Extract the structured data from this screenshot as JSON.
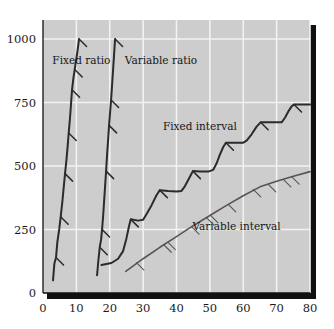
{
  "chart_data": {
    "type": "line",
    "title": "",
    "subtitle": "",
    "xlabel": "",
    "ylabel": "",
    "xlim": [
      0,
      80
    ],
    "ylim": [
      0,
      1075
    ],
    "grid": true,
    "legend_position": "inline-annotations",
    "xticks": [
      "0",
      "10",
      "20",
      "30",
      "40",
      "50",
      "60",
      "70",
      "80"
    ],
    "xtick_values": [
      0,
      10,
      20,
      30,
      40,
      50,
      60,
      70,
      80
    ],
    "yticks": [
      "0",
      "250",
      "500",
      "750",
      "1000"
    ],
    "ytick_values": [
      0,
      250,
      500,
      750,
      1000
    ],
    "plot_bgcolor": "#cdcdcd",
    "grid_color": "#f2f2f2",
    "axis_color": "#111111",
    "series": [
      {
        "name": "Fixed ratio",
        "color": "#2b2b2b",
        "width": 2.0,
        "label_x": 11.5,
        "label_y": 900,
        "label_anchor": "middle",
        "points": [
          [
            3.0,
            50
          ],
          [
            3.4,
            115
          ],
          [
            3.9,
            140
          ],
          [
            4.3,
            200
          ],
          [
            4.9,
            255
          ],
          [
            5.3,
            300
          ],
          [
            5.8,
            360
          ],
          [
            6.2,
            415
          ],
          [
            6.6,
            470
          ],
          [
            7.0,
            520
          ],
          [
            7.4,
            580
          ],
          [
            7.7,
            630
          ],
          [
            8.1,
            690
          ],
          [
            8.4,
            745
          ],
          [
            8.7,
            800
          ],
          [
            9.1,
            845
          ],
          [
            9.5,
            880
          ],
          [
            9.9,
            915
          ],
          [
            10.3,
            950
          ],
          [
            10.8,
            1000
          ]
        ],
        "hatches": [
          {
            "x": 3.9,
            "y": 140
          },
          {
            "x": 5.3,
            "y": 300
          },
          {
            "x": 6.6,
            "y": 470
          },
          {
            "x": 7.7,
            "y": 630
          },
          {
            "x": 8.7,
            "y": 800
          },
          {
            "x": 9.5,
            "y": 880
          },
          {
            "x": 10.8,
            "y": 1000
          }
        ]
      },
      {
        "name": "Variable ratio",
        "color": "#2b2b2b",
        "width": 2.0,
        "label_x": 24.5,
        "label_y": 900,
        "label_anchor": "start",
        "points": [
          [
            16.2,
            70
          ],
          [
            16.6,
            130
          ],
          [
            17.0,
            180
          ],
          [
            17.4,
            210
          ],
          [
            17.7,
            250
          ],
          [
            18.0,
            300
          ],
          [
            18.3,
            360
          ],
          [
            18.6,
            420
          ],
          [
            18.9,
            480
          ],
          [
            19.2,
            545
          ],
          [
            19.5,
            600
          ],
          [
            19.8,
            660
          ],
          [
            20.1,
            710
          ],
          [
            20.4,
            760
          ],
          [
            20.7,
            820
          ],
          [
            21.0,
            880
          ],
          [
            21.3,
            940
          ],
          [
            21.6,
            1000
          ]
        ],
        "hatches": [
          {
            "x": 17.0,
            "y": 180
          },
          {
            "x": 17.7,
            "y": 250
          },
          {
            "x": 18.9,
            "y": 480
          },
          {
            "x": 19.8,
            "y": 660
          },
          {
            "x": 20.4,
            "y": 760
          },
          {
            "x": 21.6,
            "y": 1000
          }
        ]
      },
      {
        "name": "Fixed interval",
        "color": "#2b2b2b",
        "width": 2.0,
        "label_x": 47.0,
        "label_y": 640,
        "label_anchor": "middle",
        "points": [
          [
            17.5,
            110
          ],
          [
            20.5,
            118
          ],
          [
            22.5,
            135
          ],
          [
            24.0,
            165
          ],
          [
            25.0,
            215
          ],
          [
            25.8,
            265
          ],
          [
            26.3,
            290
          ],
          [
            28.5,
            285
          ],
          [
            30.0,
            288
          ],
          [
            31.0,
            310
          ],
          [
            32.5,
            345
          ],
          [
            34.0,
            385
          ],
          [
            35.0,
            405
          ],
          [
            37.5,
            402
          ],
          [
            40.0,
            400
          ],
          [
            41.5,
            402
          ],
          [
            42.5,
            420
          ],
          [
            43.5,
            445
          ],
          [
            44.3,
            465
          ],
          [
            44.9,
            480
          ],
          [
            47.0,
            478
          ],
          [
            49.5,
            478
          ],
          [
            51.0,
            485
          ],
          [
            52.0,
            510
          ],
          [
            53.0,
            545
          ],
          [
            54.0,
            575
          ],
          [
            54.8,
            592
          ],
          [
            57.5,
            592
          ],
          [
            60.0,
            592
          ],
          [
            61.0,
            600
          ],
          [
            62.5,
            625
          ],
          [
            64.0,
            655
          ],
          [
            65.2,
            672
          ],
          [
            68.0,
            672
          ],
          [
            71.5,
            672
          ],
          [
            72.5,
            690
          ],
          [
            73.5,
            715
          ],
          [
            74.5,
            735
          ],
          [
            75.2,
            742
          ],
          [
            78.0,
            742
          ],
          [
            80.0,
            742
          ]
        ],
        "hatches": [
          {
            "x": 26.3,
            "y": 290
          },
          {
            "x": 35.0,
            "y": 405
          },
          {
            "x": 44.9,
            "y": 480
          },
          {
            "x": 54.8,
            "y": 592
          },
          {
            "x": 65.2,
            "y": 672
          },
          {
            "x": 75.2,
            "y": 742
          }
        ]
      },
      {
        "name": "Variable interval",
        "color": "#555555",
        "width": 1.6,
        "label_x": 58.0,
        "label_y": 250,
        "label_anchor": "middle",
        "points": [
          [
            24.8,
            85
          ],
          [
            30.0,
            135
          ],
          [
            35.0,
            180
          ],
          [
            40.0,
            222
          ],
          [
            45.0,
            265
          ],
          [
            50.0,
            305
          ],
          [
            55.0,
            345
          ],
          [
            60.0,
            383
          ],
          [
            65.0,
            418
          ],
          [
            70.0,
            440
          ],
          [
            75.0,
            460
          ],
          [
            80.0,
            478
          ]
        ],
        "hatches": [
          {
            "x": 28.0,
            "y": 120
          },
          {
            "x": 36.2,
            "y": 190
          },
          {
            "x": 37.4,
            "y": 200
          },
          {
            "x": 44.5,
            "y": 261
          },
          {
            "x": 49.0,
            "y": 297
          },
          {
            "x": 50.2,
            "y": 306
          },
          {
            "x": 55.5,
            "y": 349
          },
          {
            "x": 63.0,
            "y": 408
          },
          {
            "x": 67.5,
            "y": 428
          },
          {
            "x": 72.0,
            "y": 447
          },
          {
            "x": 74.5,
            "y": 458
          }
        ]
      }
    ]
  }
}
